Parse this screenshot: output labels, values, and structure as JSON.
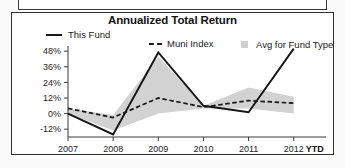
{
  "chart_panel": {
    "title": "Annualized Total Return",
    "legend": [
      {
        "key": "this_fund",
        "label": "This Fund",
        "marker": "solid-line-swatch"
      },
      {
        "key": "muni_index",
        "label": "Muni Index",
        "marker": "dashed-line-swatch"
      },
      {
        "key": "avg_fund",
        "label": "Avg for Fund Type",
        "marker": "filled-square-swatch"
      }
    ],
    "x_axis_suffix": "YTD"
  },
  "chart_data": {
    "type": "line",
    "title": "Annualized Total Return",
    "xlabel": "",
    "ylabel": "",
    "categories": [
      "2007",
      "2008",
      "2009",
      "2010",
      "2011",
      "2012"
    ],
    "x_tick_labels": [
      "2007",
      "2008",
      "2009",
      "2010",
      "2011",
      "2012"
    ],
    "x_axis_note": "YTD",
    "y_tick_labels": [
      "48%",
      "36%",
      "24%",
      "12%",
      "0%",
      "-12%"
    ],
    "y_ticks": [
      48,
      36,
      24,
      12,
      0,
      -12
    ],
    "ylim": [
      -18,
      52
    ],
    "grid": false,
    "legend_position": "top",
    "series": [
      {
        "name": "This Fund",
        "style": "solid",
        "color": "#151515",
        "values": [
          0,
          -16,
          47,
          6,
          1,
          50
        ]
      },
      {
        "name": "Muni Index",
        "style": "dashed",
        "color": "#151515",
        "values": [
          4,
          -3,
          12,
          5,
          10,
          8
        ]
      },
      {
        "name": "Avg for Fund Type",
        "style": "band",
        "color": "#d2d2d2",
        "band_upper": [
          4,
          -1,
          44,
          6,
          20,
          13
        ],
        "band_lower": [
          0,
          -13,
          0,
          4,
          4,
          0
        ]
      }
    ]
  }
}
